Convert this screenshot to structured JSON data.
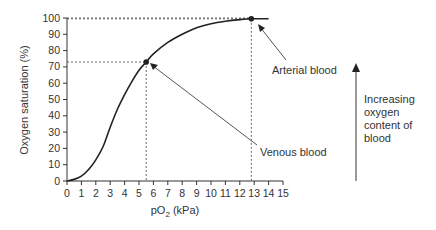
{
  "chart_data": {
    "type": "line",
    "xlabel": "pO2 (kPa)",
    "ylabel": "Oxygen saturation (%)",
    "xlim": [
      0,
      15
    ],
    "ylim": [
      0,
      100
    ],
    "x_ticks": [
      0,
      1,
      2,
      3,
      4,
      5,
      6,
      7,
      8,
      9,
      10,
      11,
      12,
      13,
      14,
      15
    ],
    "y_ticks": [
      0,
      10,
      20,
      30,
      40,
      50,
      60,
      70,
      80,
      90,
      100
    ],
    "grid": false,
    "series": [
      {
        "name": "Oxygen saturation",
        "x": [
          0,
          0.5,
          1,
          1.5,
          2,
          2.5,
          3,
          3.5,
          4,
          4.5,
          5,
          5.5,
          6,
          7,
          8,
          9,
          10,
          11,
          12,
          12.8,
          13.5,
          14
        ],
        "y": [
          0,
          1,
          3,
          7,
          13,
          21,
          33,
          44,
          53,
          61,
          68,
          73,
          78,
          85,
          90,
          94,
          96.5,
          98,
          99,
          99.5,
          99.5,
          99.5
        ]
      }
    ],
    "points": [
      {
        "label": "Venous blood",
        "x": 5.5,
        "y": 73
      },
      {
        "label": "Arterial blood",
        "x": 12.8,
        "y": 99.5
      }
    ],
    "annotations": [
      {
        "text": "Arterial blood",
        "points_to": "arterial point"
      },
      {
        "text": "Venous blood",
        "points_to": "venous point"
      },
      {
        "text": "Increasing oxygen content of blood",
        "type": "upward arrow"
      }
    ]
  },
  "labels": {
    "ylabel": "Oxygen saturation (%)",
    "xlabel_main": "pO",
    "xlabel_sub": "2",
    "xlabel_unit": " (kPa)",
    "arterial": "Arterial blood",
    "venous": "Venous blood",
    "increasing_line1": "Increasing",
    "increasing_line2": "oxygen",
    "increasing_line3": "content of",
    "increasing_line4": "blood"
  }
}
